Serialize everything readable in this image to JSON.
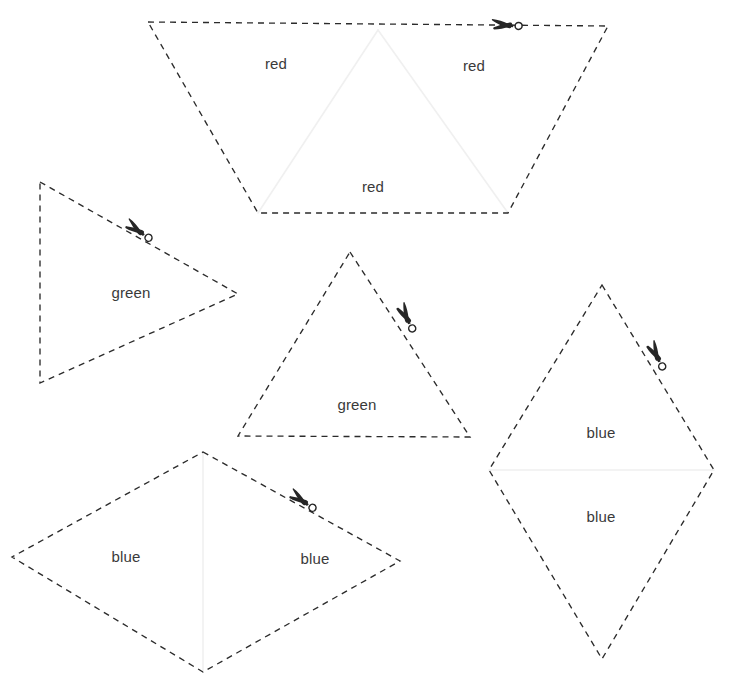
{
  "canvas": {
    "width": 733,
    "height": 686,
    "background": "#ffffff",
    "title": "Shape cutting worksheet"
  },
  "style": {
    "outline_color": "#2b2b2b",
    "divider_color": "#f0f0f0",
    "label_color": "#3a3a3a",
    "scissors_color": "#262626",
    "dash_pattern": "6 5"
  },
  "shapes": [
    {
      "id": "red-trapezoid",
      "name": "red-trapezoid",
      "outline_points": "148,22 608,26 508,213 258,213",
      "dividers": [
        {
          "name": "red-inner-left-edge",
          "points": "378,30 258,213"
        },
        {
          "name": "red-inner-right-edge",
          "points": "378,30 508,213"
        }
      ],
      "labels": [
        {
          "id": "red-label-left",
          "text": "red",
          "x": 276,
          "y": 65
        },
        {
          "id": "red-label-right",
          "text": "red",
          "x": 474,
          "y": 67
        },
        {
          "id": "red-label-bottom",
          "text": "red",
          "x": 373,
          "y": 188
        }
      ],
      "scissors": [
        {
          "id": "red-scissors",
          "x": 507,
          "y": 25,
          "rotation": -1
        }
      ]
    },
    {
      "id": "green-triangle-left",
      "name": "green-triangle-left",
      "outline_points": "40,182 238,294 40,383",
      "dividers": [],
      "labels": [
        {
          "id": "green-label-left",
          "text": "green",
          "x": 131,
          "y": 294
        }
      ],
      "scissors": [
        {
          "id": "green-left-scissors",
          "x": 139,
          "y": 231,
          "rotation": 30
        }
      ]
    },
    {
      "id": "green-triangle-middle",
      "name": "green-triangle-middle",
      "outline_points": "350,252 470,437 238,436",
      "dividers": [],
      "labels": [
        {
          "id": "green-label-middle",
          "text": "green",
          "x": 357,
          "y": 406
        }
      ],
      "scissors": [
        {
          "id": "green-middle-scissors",
          "x": 407,
          "y": 318,
          "rotation": 58
        }
      ]
    },
    {
      "id": "blue-rhombus-right",
      "name": "blue-rhombus-right",
      "outline_points": "602,285 714,470 602,659 489,470",
      "dividers": [
        {
          "name": "blue-right-horizontal-divider",
          "points": "489,470 714,470"
        }
      ],
      "labels": [
        {
          "id": "blue-label-right-top",
          "text": "blue",
          "x": 601,
          "y": 434
        },
        {
          "id": "blue-label-right-bottom",
          "text": "blue",
          "x": 601,
          "y": 518
        }
      ],
      "scissors": [
        {
          "id": "blue-right-scissors",
          "x": 657,
          "y": 356,
          "rotation": 58
        }
      ]
    },
    {
      "id": "blue-rhombus-bottom",
      "name": "blue-rhombus-bottom",
      "outline_points": "203,452 400,561 203,672 12,557",
      "dividers": [
        {
          "name": "blue-bottom-vertical-divider",
          "points": "203,452 203,672"
        }
      ],
      "labels": [
        {
          "id": "blue-label-bottom-left",
          "text": "blue",
          "x": 126,
          "y": 558
        },
        {
          "id": "blue-label-bottom-right",
          "text": "blue",
          "x": 315,
          "y": 560
        }
      ],
      "scissors": [
        {
          "id": "blue-bottom-scissors",
          "x": 303,
          "y": 501,
          "rotation": 30
        }
      ]
    }
  ],
  "icons": {
    "scissors": "scissors-icon"
  }
}
